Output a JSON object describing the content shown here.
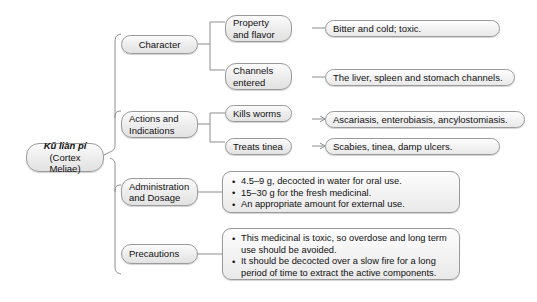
{
  "diagram": {
    "root": {
      "name": "root-node",
      "line1": "Kǔ liàn pí",
      "line2": "(Cortex Meliae)"
    },
    "branches": [
      {
        "id": "character",
        "label": "Character",
        "children": [
          {
            "id": "property-and-flavor",
            "label": "Property and flavor",
            "leaf": "Bitter and cold; toxic."
          },
          {
            "id": "channels-entered",
            "label": "Channels entered",
            "leaf": "The liver, spleen and stomach channels."
          }
        ]
      },
      {
        "id": "actions-and-indications",
        "label": "Actions and Indications",
        "children": [
          {
            "id": "kills-worms",
            "label": "Kills worms",
            "leaf": "Ascariasis, enterobiasis, ancylostomiasis."
          },
          {
            "id": "treats-tinea",
            "label": "Treats tinea",
            "leaf": "Scabies, tinea, damp ulcers."
          }
        ]
      },
      {
        "id": "administration-and-dosage",
        "label": "Administration and Dosage",
        "bullets": [
          "4.5–9 g, decocted in water for oral use.",
          "15–30 g for the fresh medicinal.",
          "An appropriate amount for external use."
        ]
      },
      {
        "id": "precautions",
        "label": "Precautions",
        "bullets": [
          "This medicinal is toxic, so overdose and long term use should be avoided.",
          "It should be decocted over a slow fire for a long period of time to extract the active components."
        ]
      }
    ],
    "colors": {
      "background": "#ffffff",
      "node_border": "#9a9a9a",
      "node_fill": "#ececec",
      "connector": "#8d8d8d",
      "text": "#111111"
    }
  }
}
